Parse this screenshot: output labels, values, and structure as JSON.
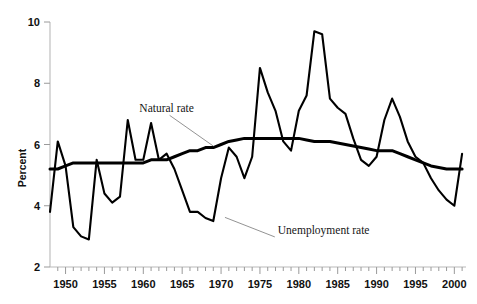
{
  "chart_data": {
    "type": "line",
    "title": "",
    "xlabel": "",
    "ylabel": "Percent",
    "xlim": [
      1948,
      2001.5
    ],
    "ylim": [
      2,
      10
    ],
    "ytick_values": [
      2,
      4,
      6,
      8,
      10
    ],
    "ytick_labels": [
      "2",
      "4",
      "6",
      "8",
      "10"
    ],
    "xtick_labels": [
      "1950",
      "1955",
      "1960",
      "1965",
      "1970",
      "1975",
      "1980",
      "1985",
      "1990",
      "1995",
      "2000"
    ],
    "xtick_values": [
      1950,
      1955,
      1960,
      1965,
      1970,
      1975,
      1980,
      1985,
      1990,
      1995,
      2000
    ],
    "minor_tick_interval": 1,
    "grid": false,
    "legend_position": "inline-annotations",
    "x": [
      1948,
      1949,
      1950,
      1951,
      1952,
      1953,
      1954,
      1955,
      1956,
      1957,
      1958,
      1959,
      1960,
      1961,
      1962,
      1963,
      1964,
      1965,
      1966,
      1967,
      1968,
      1969,
      1970,
      1971,
      1972,
      1973,
      1974,
      1975,
      1976,
      1977,
      1978,
      1979,
      1980,
      1981,
      1982,
      1983,
      1984,
      1985,
      1986,
      1987,
      1988,
      1989,
      1990,
      1991,
      1992,
      1993,
      1994,
      1995,
      1996,
      1997,
      1998,
      1999,
      2000,
      2001
    ],
    "series": [
      {
        "name": "Unemployment rate",
        "color": "#000000",
        "values": [
          3.8,
          6.1,
          5.3,
          3.3,
          3.0,
          2.9,
          5.5,
          4.4,
          4.1,
          4.3,
          6.8,
          5.5,
          5.5,
          6.7,
          5.5,
          5.7,
          5.2,
          4.5,
          3.8,
          3.8,
          3.6,
          3.5,
          4.9,
          5.9,
          5.6,
          4.9,
          5.6,
          8.5,
          7.7,
          7.1,
          6.1,
          5.8,
          7.1,
          7.6,
          9.7,
          9.6,
          7.5,
          7.2,
          7.0,
          6.2,
          5.5,
          5.3,
          5.6,
          6.8,
          7.5,
          6.9,
          6.1,
          5.6,
          5.4,
          4.9,
          4.5,
          4.2,
          4.0,
          5.7
        ]
      },
      {
        "name": "Natural rate",
        "color": "#000000",
        "values": [
          5.2,
          5.2,
          5.3,
          5.4,
          5.4,
          5.4,
          5.4,
          5.4,
          5.4,
          5.4,
          5.4,
          5.4,
          5.4,
          5.5,
          5.5,
          5.5,
          5.6,
          5.7,
          5.8,
          5.8,
          5.9,
          5.9,
          6.0,
          6.1,
          6.15,
          6.2,
          6.2,
          6.2,
          6.2,
          6.2,
          6.2,
          6.2,
          6.2,
          6.15,
          6.1,
          6.1,
          6.1,
          6.05,
          6.0,
          5.95,
          5.9,
          5.85,
          5.8,
          5.8,
          5.8,
          5.7,
          5.6,
          5.5,
          5.4,
          5.3,
          5.25,
          5.2,
          5.2,
          5.2
        ]
      }
    ],
    "annotations": [
      {
        "text": "Natural rate",
        "x": 1963.0,
        "y": 7.05,
        "target_x": 1969.0,
        "target_y": 5.95
      },
      {
        "text": "Unemployment rate",
        "x": 1977.3,
        "y": 3.08,
        "target_x": 1970.5,
        "target_y": 3.62
      }
    ]
  }
}
